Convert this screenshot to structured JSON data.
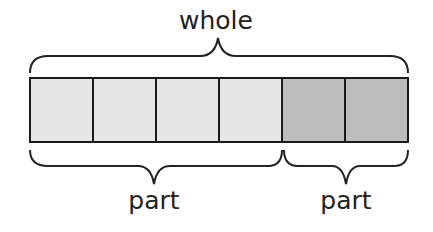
{
  "diagram": {
    "type": "bar-model",
    "labels": {
      "whole": "whole",
      "parts": [
        "part",
        "part"
      ]
    },
    "cells": [
      {
        "group": "part1",
        "color": "#e6e6e6"
      },
      {
        "group": "part1",
        "color": "#e6e6e6"
      },
      {
        "group": "part1",
        "color": "#e6e6e6"
      },
      {
        "group": "part1",
        "color": "#e6e6e6"
      },
      {
        "group": "part2",
        "color": "#bdbdbd"
      },
      {
        "group": "part2",
        "color": "#bdbdbd"
      }
    ],
    "colors": {
      "light_part": "#e6e6e6",
      "dark_part": "#bdbdbd",
      "outline": "#1a1a1a"
    }
  }
}
